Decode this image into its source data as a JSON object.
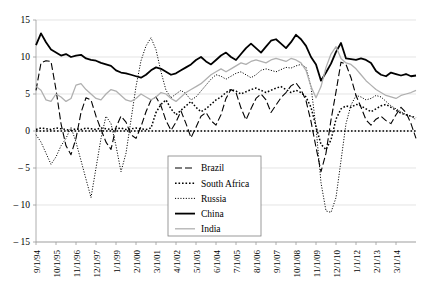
{
  "chart_data": {
    "type": "line",
    "title": "",
    "xlabel": "",
    "ylabel": "",
    "ylim": [
      -15,
      15
    ],
    "yticks": [
      15,
      10,
      5,
      0,
      -5,
      -10,
      -15
    ],
    "grid": true,
    "legend_position": "bottom-center",
    "zero_reference_line": true,
    "x_tick_labels": [
      "9/1/94",
      "10/1/95",
      "11/1/96",
      "12/1/97",
      "1/1/99",
      "2/1/00",
      "3/1/01",
      "4/1/02",
      "5/1/03",
      "6/1/04",
      "7/1/05",
      "8/1/06",
      "9/1/07",
      "10/1/08",
      "11/1/09",
      "12/1/10",
      "1/1/12",
      "2/1/13",
      "3/1/14"
    ],
    "x_tick_step": 4,
    "n_points": 77,
    "series": [
      {
        "name": "Brazil",
        "style": "dashed",
        "color": "#000000",
        "width": 1.1,
        "dash": "7,3",
        "values": [
          5.5,
          9.2,
          9.5,
          9.4,
          5.6,
          1.0,
          -2.0,
          -3.2,
          -1.0,
          2.5,
          4.5,
          4.2,
          2.0,
          0.2,
          -1.5,
          -2.5,
          0.5,
          2.0,
          1.2,
          -0.5,
          -1.0,
          0.6,
          2.6,
          4.2,
          4.6,
          3.4,
          1.4,
          0.1,
          1.2,
          2.7,
          1.0,
          -0.9,
          0.5,
          2.0,
          2.5,
          1.4,
          0.8,
          2.2,
          4.4,
          5.6,
          5.2,
          3.1,
          1.5,
          3.0,
          4.4,
          5.0,
          4.2,
          2.5,
          3.5,
          4.5,
          5.2,
          6.1,
          6.5,
          5.6,
          4.1,
          1.3,
          -2.2,
          -5.5,
          -3.0,
          1.5,
          5.3,
          9.3,
          9.0,
          7.2,
          4.8,
          3.2,
          1.5,
          0.8,
          1.6,
          2.0,
          1.4,
          1.0,
          2.2,
          3.2,
          2.5,
          1.0,
          -1.0
        ]
      },
      {
        "name": "South Africa",
        "style": "dotted-thick",
        "color": "#000000",
        "width": 1.5,
        "dash": "1.6,1.9",
        "values": [
          0.2,
          0.4,
          0.3,
          0.2,
          0.4,
          0.3,
          0.2,
          0.1,
          0.3,
          0.2,
          0.4,
          0.3,
          0.2,
          0.4,
          0.3,
          0.2,
          0.3,
          0.4,
          0.2,
          0.3,
          0.4,
          0.3,
          0.2,
          0.4,
          2.5,
          3.6,
          4.2,
          3.0,
          2.2,
          2.8,
          3.4,
          4.0,
          3.2,
          2.6,
          3.0,
          3.6,
          4.2,
          4.6,
          5.2,
          5.6,
          5.4,
          5.0,
          5.3,
          5.6,
          5.8,
          5.5,
          5.2,
          5.5,
          5.8,
          6.0,
          5.6,
          5.2,
          5.5,
          5.2,
          4.6,
          3.2,
          0.6,
          -1.8,
          -2.5,
          -1.2,
          1.6,
          3.0,
          3.4,
          3.2,
          3.6,
          3.4,
          3.0,
          2.6,
          3.0,
          3.4,
          3.6,
          3.2,
          2.8,
          2.4,
          2.2,
          2.0,
          1.8
        ]
      },
      {
        "name": "Russia",
        "style": "dotted-fine",
        "color": "#000000",
        "width": 1.0,
        "dash": "1.1,1.6",
        "values": [
          -0.5,
          -1.5,
          -3.0,
          -4.5,
          -3.5,
          -2.0,
          -1.0,
          0.5,
          -1.5,
          -4.0,
          -6.5,
          -9.0,
          -5.0,
          -1.0,
          2.0,
          1.0,
          -2.0,
          -5.5,
          -3.0,
          1.5,
          6.0,
          9.5,
          11.5,
          12.6,
          11.0,
          8.0,
          5.5,
          4.5,
          5.0,
          5.5,
          5.0,
          4.2,
          4.6,
          5.4,
          6.2,
          7.0,
          7.6,
          7.4,
          7.0,
          7.4,
          7.8,
          8.0,
          7.6,
          7.2,
          7.6,
          8.2,
          8.4,
          8.2,
          8.0,
          8.3,
          8.6,
          8.5,
          8.8,
          9.0,
          8.6,
          6.0,
          0.5,
          -7.0,
          -10.8,
          -11.0,
          -9.0,
          -4.0,
          1.0,
          3.5,
          4.8,
          4.6,
          4.2,
          4.4,
          4.8,
          4.6,
          4.0,
          3.4,
          3.0,
          2.6,
          2.2,
          2.0,
          1.5
        ]
      },
      {
        "name": "China",
        "style": "solid-thick",
        "color": "#000000",
        "width": 1.8,
        "dash": "",
        "values": [
          11.6,
          13.2,
          12.0,
          11.0,
          10.6,
          10.2,
          10.4,
          10.0,
          10.2,
          10.3,
          9.8,
          9.6,
          9.5,
          9.2,
          9.0,
          8.8,
          8.2,
          7.9,
          7.8,
          7.6,
          7.4,
          7.2,
          7.6,
          8.2,
          8.6,
          8.4,
          8.0,
          7.6,
          7.8,
          8.2,
          8.6,
          9.0,
          9.6,
          10.0,
          9.4,
          9.0,
          9.6,
          10.2,
          10.6,
          10.0,
          9.6,
          10.4,
          11.2,
          11.8,
          11.2,
          10.6,
          11.4,
          12.2,
          12.4,
          11.8,
          11.2,
          12.0,
          13.0,
          12.4,
          11.5,
          10.0,
          9.0,
          6.8,
          7.9,
          9.1,
          10.7,
          11.9,
          9.8,
          9.7,
          9.6,
          9.8,
          9.6,
          9.2,
          8.1,
          7.6,
          7.4,
          7.9,
          7.7,
          7.5,
          7.7,
          7.4,
          7.5
        ]
      },
      {
        "name": "India",
        "style": "solid-light",
        "color": "#b0b0b0",
        "width": 1.3,
        "dash": "",
        "values": [
          6.0,
          5.5,
          4.2,
          4.0,
          5.0,
          4.6,
          4.0,
          4.4,
          6.2,
          6.4,
          5.6,
          5.0,
          4.4,
          4.2,
          5.0,
          5.6,
          5.4,
          4.8,
          4.2,
          4.0,
          4.4,
          5.0,
          4.6,
          4.2,
          4.6,
          5.2,
          5.0,
          4.4,
          4.0,
          4.6,
          5.2,
          5.6,
          6.0,
          6.4,
          7.0,
          7.6,
          8.0,
          8.4,
          8.0,
          8.4,
          8.8,
          9.2,
          9.0,
          9.4,
          9.6,
          9.4,
          9.2,
          9.6,
          9.8,
          9.6,
          9.4,
          9.8,
          9.6,
          9.2,
          8.2,
          6.0,
          4.5,
          6.0,
          8.6,
          10.4,
          11.4,
          9.8,
          9.2,
          9.0,
          8.4,
          7.6,
          6.8,
          6.2,
          5.6,
          5.2,
          4.8,
          4.6,
          4.4,
          4.8,
          5.0,
          5.2,
          5.5
        ]
      }
    ]
  },
  "legend": {
    "items": [
      "Brazil",
      "South Africa",
      "Russia",
      "China",
      "India"
    ]
  }
}
